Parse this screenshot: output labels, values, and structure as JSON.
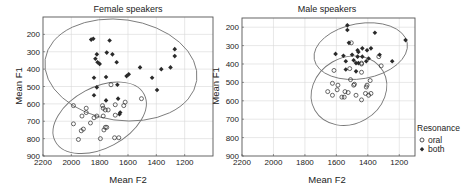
{
  "chart_data": [
    {
      "type": "scatter",
      "title": "Female speakers",
      "xlabel": "Mean F2",
      "ylabel": "Mean F1",
      "xlim": [
        2200,
        1000
      ],
      "ylim": [
        900,
        100
      ],
      "x_reversed": true,
      "y_reversed": true,
      "xticks": [
        2200,
        2000,
        1800,
        1600,
        1400,
        1200
      ],
      "yticks": [
        200,
        300,
        400,
        500,
        600,
        700,
        800,
        900
      ],
      "grid": true,
      "series": [
        {
          "name": "oral",
          "marker": "open-circle",
          "points": [
            [
              1985,
              610
            ],
            [
              1895,
              625
            ],
            [
              1895,
              650
            ],
            [
              1925,
              670
            ],
            [
              1840,
              680
            ],
            [
              1985,
              715
            ],
            [
              1865,
              710
            ],
            [
              1915,
              745
            ],
            [
              1930,
              755
            ],
            [
              1950,
              805
            ],
            [
              1780,
              610
            ],
            [
              1775,
              625
            ],
            [
              1760,
              635
            ],
            [
              1740,
              635
            ],
            [
              1775,
              670
            ],
            [
              1690,
              605
            ],
            [
              1620,
              590
            ],
            [
              1630,
              610
            ],
            [
              1690,
              665
            ],
            [
              1505,
              570
            ],
            [
              1720,
              490
            ],
            [
              1760,
              735
            ],
            [
              1770,
              750
            ],
            [
              1750,
              735
            ],
            [
              1795,
              800
            ],
            [
              1695,
              795
            ],
            [
              1665,
              795
            ],
            [
              1820,
              670
            ]
          ]
        },
        {
          "name": "both",
          "marker": "filled-diamond",
          "points": [
            [
              1860,
              230
            ],
            [
              1845,
              225
            ],
            [
              1730,
              235
            ],
            [
              1820,
              315
            ],
            [
              1750,
              305
            ],
            [
              1710,
              315
            ],
            [
              1830,
              340
            ],
            [
              1815,
              360
            ],
            [
              1800,
              370
            ],
            [
              1680,
              360
            ],
            [
              1515,
              390
            ],
            [
              1840,
              450
            ],
            [
              1755,
              445
            ],
            [
              1610,
              440
            ],
            [
              1595,
              430
            ],
            [
              1430,
              450
            ],
            [
              1365,
              400
            ],
            [
              1300,
              390
            ],
            [
              1270,
              325
            ],
            [
              1270,
              285
            ],
            [
              1820,
              505
            ],
            [
              1675,
              490
            ],
            [
              1395,
              520
            ],
            [
              1840,
              550
            ],
            [
              1755,
              580
            ],
            [
              1670,
              570
            ],
            [
              1655,
              650
            ],
            [
              1660,
              660
            ]
          ]
        }
      ],
      "ellipses": [
        {
          "group": "both",
          "center": [
            1650,
            405
          ],
          "semi_axes": [
            540,
            290
          ],
          "angle_deg": 8
        },
        {
          "group": "oral",
          "center": [
            1800,
            680
          ],
          "semi_axes": [
            355,
            175
          ],
          "angle_deg": -28
        }
      ]
    },
    {
      "type": "scatter",
      "title": "Male speakers",
      "xlabel": "Mean F2",
      "ylabel": "Mean F1",
      "xlim": [
        2200,
        1100
      ],
      "ylim": [
        900,
        150
      ],
      "x_reversed": true,
      "y_reversed": true,
      "xticks": [
        2200,
        2000,
        1800,
        1600,
        1400,
        1200
      ],
      "yticks": [
        200,
        300,
        400,
        500,
        600,
        700,
        800,
        900
      ],
      "grid": true,
      "series": [
        {
          "name": "oral",
          "marker": "open-circle",
          "points": [
            [
              1505,
              285
            ],
            [
              1615,
              435
            ],
            [
              1515,
              425
            ],
            [
              1440,
              445
            ],
            [
              1315,
              410
            ],
            [
              1330,
              360
            ],
            [
              1440,
              395
            ],
            [
              1625,
              505
            ],
            [
              1590,
              515
            ],
            [
              1510,
              485
            ],
            [
              1490,
              515
            ],
            [
              1385,
              490
            ],
            [
              1405,
              515
            ],
            [
              1655,
              550
            ],
            [
              1595,
              540
            ],
            [
              1545,
              550
            ],
            [
              1525,
              555
            ],
            [
              1625,
              570
            ],
            [
              1565,
              580
            ],
            [
              1550,
              580
            ],
            [
              1475,
              570
            ],
            [
              1440,
              595
            ],
            [
              1415,
              560
            ],
            [
              1395,
              570
            ],
            [
              1380,
              560
            ],
            [
              1485,
              510
            ],
            [
              1410,
              525
            ],
            [
              1440,
              400
            ]
          ]
        },
        {
          "name": "both",
          "marker": "filled-diamond",
          "points": [
            [
              1530,
              190
            ],
            [
              1530,
              215
            ],
            [
              1355,
              230
            ],
            [
              1160,
              270
            ],
            [
              1520,
              285
            ],
            [
              1605,
              345
            ],
            [
              1555,
              355
            ],
            [
              1540,
              385
            ],
            [
              1465,
              325
            ],
            [
              1460,
              335
            ],
            [
              1435,
              315
            ],
            [
              1405,
              325
            ],
            [
              1380,
              315
            ],
            [
              1490,
              380
            ],
            [
              1475,
              395
            ],
            [
              1460,
              395
            ],
            [
              1410,
              385
            ],
            [
              1395,
              370
            ],
            [
              1325,
              350
            ],
            [
              1245,
              385
            ],
            [
              1540,
              430
            ],
            [
              1475,
              440
            ],
            [
              1500,
              350
            ],
            [
              1435,
              360
            ],
            [
              1465,
              360
            ]
          ]
        }
      ],
      "ellipses": [
        {
          "group": "both",
          "center": [
            1445,
            330
          ],
          "semi_axes": [
            300,
            150
          ],
          "angle_deg": -10
        },
        {
          "group": "oral",
          "center": [
            1520,
            545
          ],
          "semi_axes": [
            250,
            180
          ],
          "angle_deg": -30
        }
      ]
    }
  ],
  "legend": {
    "title": "Resonance",
    "placement": "right",
    "items": [
      {
        "label": "oral",
        "marker": "open-circle"
      },
      {
        "label": "both",
        "marker": "filled-diamond"
      }
    ]
  },
  "colors": {
    "axis": "#555555",
    "grid": "#d8d8d8",
    "marker": "#2a2a2a",
    "ellipse": "#777777"
  }
}
